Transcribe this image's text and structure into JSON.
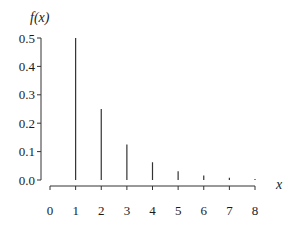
{
  "chart_data": {
    "type": "bar",
    "subtype": "stem",
    "title": "",
    "xlabel": "x",
    "ylabel": "f(x)",
    "categories": [
      1,
      2,
      3,
      4,
      5,
      6,
      7,
      8
    ],
    "values": [
      0.5,
      0.25,
      0.125,
      0.0625,
      0.03125,
      0.015625,
      0.0078125,
      0.00390625
    ],
    "x_ticks": [
      "0",
      "1",
      "2",
      "3",
      "4",
      "5",
      "6",
      "7",
      "8"
    ],
    "y_ticks": [
      "0.0",
      "0.1",
      "0.2",
      "0.3",
      "0.4",
      "0.5"
    ],
    "xlim": [
      0,
      8
    ],
    "ylim": [
      0,
      0.5
    ],
    "grid": false,
    "legend": null,
    "colors": {
      "stem": "#333333",
      "axis": "#333333",
      "text": "#1a1a1a"
    }
  }
}
